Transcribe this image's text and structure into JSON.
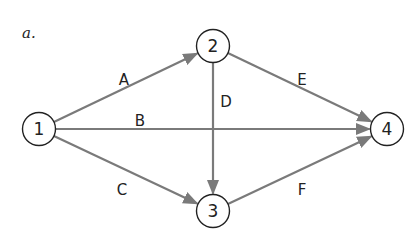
{
  "part_label": "a.",
  "colors": {
    "edge": "#7a7a7a",
    "node_stroke": "#222222",
    "text": "#222222",
    "background": "#ffffff"
  },
  "nodes": [
    {
      "id": "1",
      "label": "1",
      "x": 39,
      "y": 129
    },
    {
      "id": "2",
      "label": "2",
      "x": 213,
      "y": 46
    },
    {
      "id": "3",
      "label": "3",
      "x": 213,
      "y": 211
    },
    {
      "id": "4",
      "label": "4",
      "x": 387,
      "y": 129
    }
  ],
  "edges": [
    {
      "label": "A",
      "from": "1",
      "to": "2",
      "label_x": 124,
      "label_y": 80
    },
    {
      "label": "B",
      "from": "1",
      "to": "4",
      "label_x": 140,
      "label_y": 121
    },
    {
      "label": "C",
      "from": "1",
      "to": "3",
      "label_x": 122,
      "label_y": 190
    },
    {
      "label": "D",
      "from": "2",
      "to": "3",
      "label_x": 226,
      "label_y": 102
    },
    {
      "label": "E",
      "from": "2",
      "to": "4",
      "label_x": 302,
      "label_y": 80
    },
    {
      "label": "F",
      "from": "3",
      "to": "4",
      "label_x": 302,
      "label_y": 190
    }
  ]
}
